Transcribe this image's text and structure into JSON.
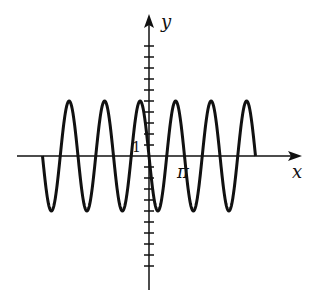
{
  "chart_data": {
    "type": "line",
    "title": "",
    "function": "y = -5 sin(2x)",
    "xlabel": "x",
    "ylabel": "y",
    "x_tick_labels": [
      "π"
    ],
    "y_tick_labels": [
      "1"
    ],
    "amplitude": 5,
    "period": "π",
    "domain": [
      "-3π",
      "3π"
    ],
    "xlim": [
      "-3.5π",
      "4.3π"
    ],
    "ylim": [
      -10,
      10
    ],
    "grid": false,
    "legend": null,
    "series": [
      {
        "name": "y = -5 sin(2x)",
        "x_start_pi": -3,
        "x_end_pi": 3
      }
    ]
  },
  "labels": {
    "x_axis": "x",
    "y_axis": "y",
    "pi": "π",
    "one": "1"
  }
}
